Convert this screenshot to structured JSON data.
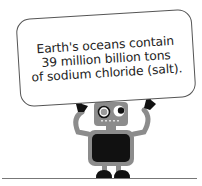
{
  "fact_card": {
    "lines": [
      "Earth's oceans contain",
      "39 million billion tons",
      "of sodium chloride (salt)."
    ]
  },
  "colors": {
    "robot_gray": "#8c8c8c",
    "robot_dark": "#111111",
    "border": "#555555",
    "ground": "#777777"
  }
}
